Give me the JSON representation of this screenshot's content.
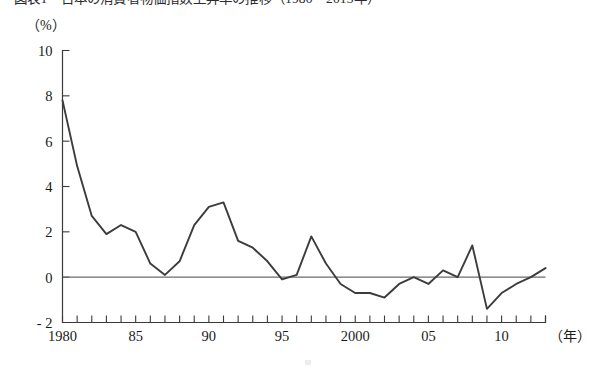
{
  "figure": {
    "title_clipped": "図表1　日本の消費者物価指数上昇率の推移（1980〜2013年）",
    "unit_label": "（%）",
    "xaxis_unit_label": "（年）"
  },
  "chart_data": {
    "type": "line",
    "title": "図表1　日本の消費者物価指数上昇率の推移（1980〜2013年）",
    "xlabel": "（年）",
    "ylabel": "（%）",
    "xlim": [
      1980,
      2013
    ],
    "ylim": [
      -2,
      10
    ],
    "yticks": [
      -2,
      0,
      2,
      4,
      6,
      8,
      10
    ],
    "ytick_labels": [
      "- 2",
      "0",
      "2",
      "4",
      "6",
      "8",
      "10"
    ],
    "xticks": [
      1980,
      1985,
      1990,
      1995,
      2000,
      2005,
      2010
    ],
    "xtick_labels": [
      "1980",
      "85",
      "90",
      "95",
      "2000",
      "05",
      "10"
    ],
    "minor_xticks_every": 1,
    "grid": false,
    "legend": false,
    "zero_line": true,
    "series": [
      {
        "name": "消費者物価指数上昇率",
        "color": "#3c3c3c",
        "x": [
          1980,
          1981,
          1982,
          1983,
          1984,
          1985,
          1986,
          1987,
          1988,
          1989,
          1990,
          1991,
          1992,
          1993,
          1994,
          1995,
          1996,
          1997,
          1998,
          1999,
          2000,
          2001,
          2002,
          2003,
          2004,
          2005,
          2006,
          2007,
          2008,
          2009,
          2010,
          2011,
          2012,
          2013
        ],
        "values": [
          7.8,
          4.9,
          2.7,
          1.9,
          2.3,
          2.0,
          0.6,
          0.1,
          0.7,
          2.3,
          3.1,
          3.3,
          1.6,
          1.3,
          0.7,
          -0.1,
          0.1,
          1.8,
          0.6,
          -0.3,
          -0.7,
          -0.7,
          -0.9,
          -0.3,
          0.0,
          -0.3,
          0.3,
          0.0,
          1.4,
          -1.4,
          -0.7,
          -0.3,
          0.0,
          0.4
        ]
      }
    ]
  }
}
